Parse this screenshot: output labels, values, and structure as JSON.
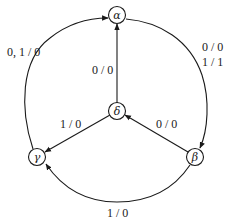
{
  "diagram": {
    "type": "state-machine",
    "nodes": [
      {
        "id": "alpha",
        "label": "α"
      },
      {
        "id": "beta",
        "label": "β"
      },
      {
        "id": "gamma",
        "label": "γ"
      },
      {
        "id": "delta",
        "label": "δ"
      }
    ],
    "edges": [
      {
        "from": "gamma",
        "to": "alpha",
        "label": "0, 1 / 0"
      },
      {
        "from": "alpha",
        "to": "beta",
        "label_line1": "0 / 0",
        "label_line2": "1 / 1"
      },
      {
        "from": "delta",
        "to": "alpha",
        "label": "0 / 0"
      },
      {
        "from": "delta",
        "to": "gamma",
        "label": "1 / 0"
      },
      {
        "from": "beta",
        "to": "delta",
        "label": "0 / 0"
      },
      {
        "from": "beta",
        "to": "gamma",
        "label": "1 / 0"
      }
    ],
    "colors": {
      "stroke": "#1a1a1a",
      "background": "#ffffff"
    }
  }
}
